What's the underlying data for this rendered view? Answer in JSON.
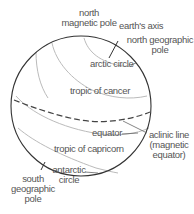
{
  "diagram": {
    "type": "globe-magnetic-diagram",
    "colors": {
      "outline": "#333333",
      "latitude_lines": "#bbbbbb",
      "magnetic_equator": "#444444",
      "leader_lines": "#666666",
      "text": "#555555",
      "background": "#ffffff"
    },
    "labels": {
      "north_magnetic_pole": {
        "line1": "north",
        "line2": "magnetic pole"
      },
      "earths_axis": "earth's axis",
      "north_geographic_pole": {
        "line1": "north geographic",
        "line2": "pole"
      },
      "arctic_circle": "arctic circle",
      "tropic_of_cancer": "tropic of cancer",
      "equator": "equator",
      "aclinic_line": {
        "line1": "aclinic line",
        "line2": "(magnetic",
        "line3": "equator)"
      },
      "tropic_of_capricorn": "tropic of capricorn",
      "antarctic_circle": {
        "line1": "antarctic",
        "line2": "circle"
      },
      "south_geographic_pole": {
        "line1": "south",
        "line2": "geographic",
        "line3": "pole"
      }
    }
  }
}
